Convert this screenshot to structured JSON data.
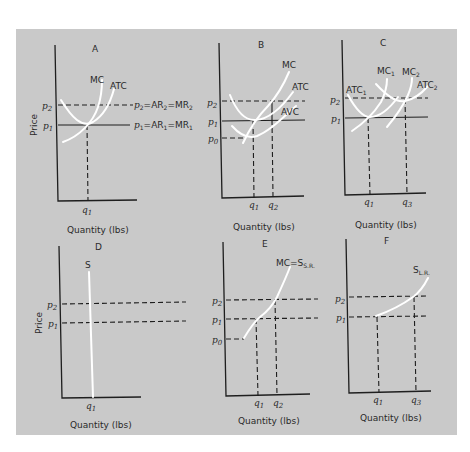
{
  "figure": {
    "background_color": "#c9c9c9",
    "curve_color": "#ffffff",
    "line_color": "#1e1e1e",
    "y_axis_label": "Price",
    "x_axis_label": "Quantity (lbs)"
  },
  "panels": {
    "A": {
      "title": "A",
      "ylabel": "Price",
      "xlabel": "Quantity (lbs)",
      "curves": [
        "MC",
        "ATC"
      ],
      "price_ticks": [
        "p2",
        "p1"
      ],
      "qty_ticks": [
        "q1"
      ],
      "line_labels": {
        "p2": "p2=AR2=MR2",
        "p1": "p1=AR1=MR1"
      }
    },
    "B": {
      "title": "B",
      "xlabel": "Quantity (lbs)",
      "curves": [
        "MC",
        "ATC",
        "AVC"
      ],
      "price_ticks": [
        "p2",
        "p1",
        "p0"
      ],
      "qty_ticks": [
        "q1",
        "q2"
      ]
    },
    "C": {
      "title": "C",
      "xlabel": "Quantity (lbs)",
      "curves": [
        "ATC1",
        "MC1",
        "MC2",
        "ATC2"
      ],
      "price_ticks": [
        "p2",
        "p1"
      ],
      "qty_ticks": [
        "q1",
        "q3"
      ]
    },
    "D": {
      "title": "D",
      "ylabel": "Price",
      "xlabel": "Quantity (lbs)",
      "curves": [
        "S"
      ],
      "price_ticks": [
        "p2",
        "p1"
      ],
      "qty_ticks": [
        "q1"
      ]
    },
    "E": {
      "title": "E",
      "xlabel": "Quantity (lbs)",
      "curves": [
        "MC=S S.R."
      ],
      "price_ticks": [
        "p2",
        "p1",
        "p0"
      ],
      "qty_ticks": [
        "q1",
        "q2"
      ]
    },
    "F": {
      "title": "F",
      "xlabel": "Quantity (lbs)",
      "curves": [
        "S L.R."
      ],
      "price_ticks": [
        "p2",
        "p1"
      ],
      "qty_ticks": [
        "q1",
        "q3"
      ]
    }
  },
  "text": {
    "A_title": "A",
    "B_title": "B",
    "C_title": "C",
    "D_title": "D",
    "E_title": "E",
    "F_title": "F",
    "price": "Price",
    "quantity": "Quantity (lbs)",
    "mc": "MC",
    "atc": "ATC",
    "avc": "AVC",
    "atc1": "ATC",
    "atc2": "ATC",
    "mc1": "MC",
    "mc2": "MC",
    "sub1": "1",
    "sub2": "2",
    "sub3": "3",
    "sub0": "0",
    "p": "p",
    "q": "q",
    "s": "S",
    "mc_eq_s": "MC=S",
    "sr": "S.R.",
    "lr": "L.R.",
    "ar_mr_2": "=AR",
    "mr_eq": "=MR"
  }
}
